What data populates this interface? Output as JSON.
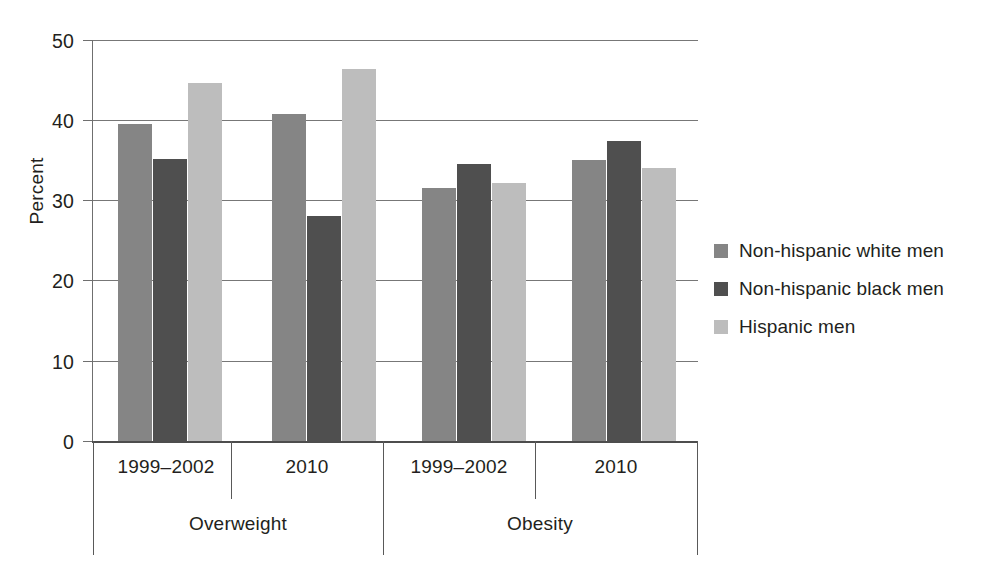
{
  "chart_data": {
    "type": "bar",
    "title": "",
    "xlabel": "",
    "ylabel": "Percent",
    "ylim": [
      0,
      50
    ],
    "yticks": [
      0,
      10,
      20,
      30,
      40,
      50
    ],
    "ytick_labels": [
      "0",
      "10",
      "20",
      "30",
      "40",
      "50"
    ],
    "grid": true,
    "legend_position": "right",
    "groups": [
      "Overweight",
      "Obesity"
    ],
    "categories": [
      "1999–2002",
      "2010",
      "1999–2002",
      "2010"
    ],
    "category_groups": [
      "Overweight",
      "Overweight",
      "Obesity",
      "Obesity"
    ],
    "series": [
      {
        "name": "Non-hispanic white men",
        "color": "#858585",
        "values": [
          39.5,
          40.8,
          31.5,
          35.0
        ]
      },
      {
        "name": "Non-hispanic black men",
        "color": "#4f4f4f",
        "values": [
          35.2,
          28.0,
          34.5,
          37.4
        ]
      },
      {
        "name": "Hispanic men",
        "color": "#bdbdbd",
        "values": [
          44.6,
          46.4,
          32.2,
          34.0
        ]
      }
    ]
  },
  "axis": {
    "y_title": "Percent",
    "y_tick_0": "0",
    "y_tick_1": "10",
    "y_tick_2": "20",
    "y_tick_3": "30",
    "y_tick_4": "40",
    "y_tick_5": "50"
  },
  "x_labels": {
    "sub_0": "1999–2002",
    "sub_1": "2010",
    "sub_2": "1999–2002",
    "sub_3": "2010",
    "group_0": "Overweight",
    "group_1": "Obesity"
  },
  "legend": {
    "items": [
      {
        "label": "Non-hispanic white men",
        "color": "#858585"
      },
      {
        "label": "Non-hispanic black men",
        "color": "#4f4f4f"
      },
      {
        "label": "Hispanic men",
        "color": "#bdbdbd"
      }
    ]
  }
}
